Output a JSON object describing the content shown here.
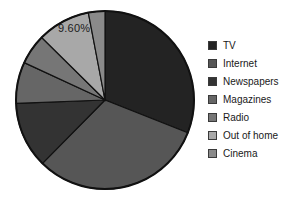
{
  "chart_data": {
    "type": "pie",
    "title": "",
    "subtitle": "",
    "xlabel": "",
    "ylabel": "",
    "grid": false,
    "legend_position": "right",
    "start_angle_deg": 0,
    "direction": "clockwise",
    "categories": [
      "TV",
      "Internet",
      "Newspapers",
      "Magazines",
      "Radio",
      "Out of home",
      "Cinema"
    ],
    "values": [
      31.0,
      31.4,
      12.0,
      7.5,
      5.5,
      9.6,
      3.0
    ],
    "labels": [
      "",
      "",
      "",
      "",
      "",
      "9.60%",
      ""
    ],
    "visible_data_labels": [
      {
        "category": "Out of home",
        "text": "9.60%"
      }
    ],
    "colors": [
      "#232323",
      "#565656",
      "#333333",
      "#666666",
      "#767676",
      "#a8a8a8",
      "#8a8a8a"
    ],
    "slices": [
      {
        "label": "TV",
        "value": 31.0,
        "color": "#232323"
      },
      {
        "label": "Internet",
        "value": 31.4,
        "color": "#565656"
      },
      {
        "label": "Newspapers",
        "value": 12.0,
        "color": "#333333"
      },
      {
        "label": "Magazines",
        "value": 7.5,
        "color": "#666666"
      },
      {
        "label": "Radio",
        "value": 5.5,
        "color": "#767676"
      },
      {
        "label": "Out of home",
        "value": 9.6,
        "color": "#a8a8a8"
      },
      {
        "label": "Cinema",
        "value": 3.0,
        "color": "#8a8a8a"
      }
    ]
  },
  "chart": {
    "data_label": "9.60%",
    "outline_color": "#111111",
    "background": "#ffffff"
  },
  "legend": {
    "items": [
      {
        "label": "TV",
        "color": "#232323"
      },
      {
        "label": "Internet",
        "color": "#565656"
      },
      {
        "label": "Newspapers",
        "color": "#333333"
      },
      {
        "label": "Magazines",
        "color": "#666666"
      },
      {
        "label": "Radio",
        "color": "#767676"
      },
      {
        "label": "Out of home",
        "color": "#a8a8a8"
      },
      {
        "label": "Cinema",
        "color": "#8a8a8a"
      }
    ]
  }
}
